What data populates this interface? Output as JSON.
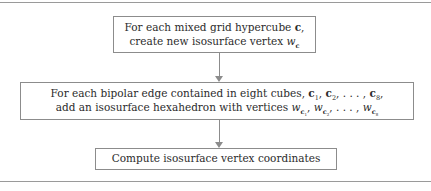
{
  "figure": {
    "type": "flowchart",
    "orientation": "top-to-bottom",
    "rules": {
      "top_label": "figure-top-rule",
      "bottom_label": "figure-bottom-rule",
      "color": "#9a9a9a"
    },
    "box_border_color": "#8c8c8c",
    "text_color": "#2b2b2b",
    "arrow_color": "#8c8c8c"
  },
  "boxes": [
    {
      "id": "box-1",
      "line1_pre": "For each mixed grid hypercube ",
      "line1_sym": "c",
      "line1_post": ",",
      "line2_pre": "create new isosurface vertex ",
      "line2_sym": "w",
      "line2_sub": "c",
      "line2_post": ""
    },
    {
      "id": "box-2",
      "line1_pre": "For each bipolar edge contained in eight cubes, ",
      "line1_c1": "c",
      "line1_c1_sub": "1",
      "line1_sep1": ", ",
      "line1_c2": "c",
      "line1_c2_sub": "2",
      "line1_sep2": ", . . . , ",
      "line1_c8": "c",
      "line1_c8_sub": "8",
      "line1_post": ",",
      "line2_pre": "add an isosurface hexahedron with vertices ",
      "line2_w1": "w",
      "line2_w1_sub_sym": "c",
      "line2_w1_sub_idx": "1",
      "line2_sep1": ", ",
      "line2_w2": "w",
      "line2_w2_sub_sym": "c",
      "line2_w2_sub_idx": "2",
      "line2_sep2": ", . . . , ",
      "line2_w8": "w",
      "line2_w8_sub_sym": "c",
      "line2_w8_sub_idx": "8",
      "line2_post": ""
    },
    {
      "id": "box-3",
      "line1": "Compute isosurface vertex coordinates"
    }
  ],
  "arrows": [
    {
      "id": "arrow-1",
      "from": "box-1",
      "to": "box-2",
      "glyph": "down-arrow"
    },
    {
      "id": "arrow-2",
      "from": "box-2",
      "to": "box-3",
      "glyph": "down-arrow"
    }
  ]
}
